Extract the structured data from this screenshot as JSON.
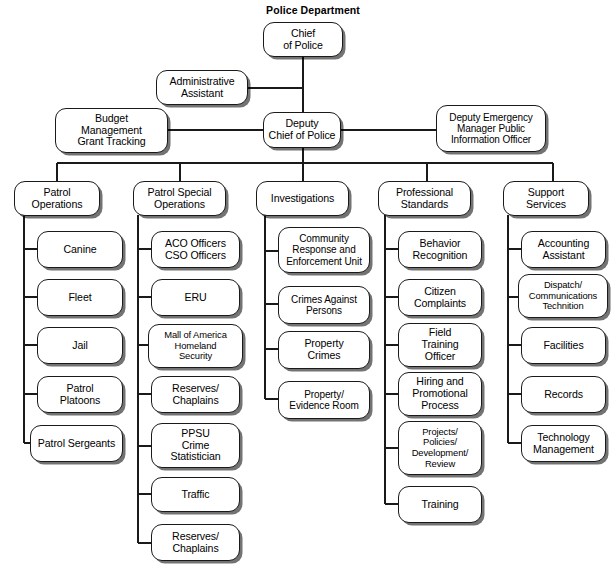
{
  "title": "Police Department",
  "colors": {
    "border": "#1a1a1a",
    "fill": "#ffffff",
    "shadow": "#000000",
    "text": "#000000"
  },
  "chart_data": {
    "type": "diagram",
    "subtype": "organizational-chart",
    "title": "Police Department",
    "orientation": "top-down",
    "nodes": [
      {
        "id": "chief",
        "label": "Chief\nof Police",
        "level": 0
      },
      {
        "id": "admin_assistant",
        "label": "Administrative\nAssistant",
        "level": 1,
        "attached_to": "chief-deputy-trunk"
      },
      {
        "id": "budget",
        "label": "Budget\nManagement\nGrant Tracking",
        "level": 2,
        "attached_to": "deputy_chief"
      },
      {
        "id": "deputy_chief",
        "label": "Deputy\nChief of Police",
        "level": 2,
        "parent": "chief"
      },
      {
        "id": "deputy_emergency",
        "label": "Deputy Emergency\nManager Public\nInformation Officer",
        "level": 2,
        "attached_to": "deputy_chief"
      }
    ],
    "divisions": [
      {
        "id": "patrol_operations",
        "label": "Patrol\nOperations",
        "parent": "deputy_chief",
        "children": [
          "Canine",
          "Fleet",
          "Jail",
          "Patrol\nPlatoons",
          "Patrol Sergeants"
        ]
      },
      {
        "id": "patrol_special_operations",
        "label": "Patrol Special\nOperations",
        "parent": "deputy_chief",
        "children": [
          "ACO Officers\nCSO Officers",
          "ERU",
          "Mall of America\nHomeland\nSecurity",
          "Reserves/\nChaplains",
          "PPSU\nCrime\nStatistician",
          "Traffic",
          "Reserves/\nChaplains"
        ]
      },
      {
        "id": "investigations",
        "label": "Investigations",
        "parent": "deputy_chief",
        "children": [
          "Community\nResponse and\nEnforcement Unit",
          "Crimes Against\nPersons",
          "Property\nCrimes",
          "Property/\nEvidence Room"
        ]
      },
      {
        "id": "professional_standards",
        "label": "Professional\nStandards",
        "parent": "deputy_chief",
        "children": [
          "Behavior\nRecognition",
          "Citizen\nComplaints",
          "Field\nTraining\nOfficer",
          "Hiring and\nPromotional\nProcess",
          "Projects/\nPolicies/\nDevelopment/\nReview",
          "Training"
        ]
      },
      {
        "id": "support_services",
        "label": "Support\nServices",
        "parent": "deputy_chief",
        "children": [
          "Accounting\nAssistant",
          "Dispatch/\nCommunications\nTechnition",
          "Facilities",
          "Records",
          "Technology\nManagement"
        ]
      }
    ]
  },
  "nodes": {
    "chief": "Chief\nof Police",
    "admin_assistant": "Administrative\nAssistant",
    "budget": "Budget\nManagement\nGrant Tracking",
    "deputy_chief": "Deputy\nChief of Police",
    "deputy_emergency": "Deputy Emergency\nManager Public\nInformation Officer",
    "div1": "Patrol\nOperations",
    "div2": "Patrol Special\nOperations",
    "div3": "Investigations",
    "div4": "Professional\nStandards",
    "div5": "Support\nServices",
    "c1_0": "Canine",
    "c1_1": "Fleet",
    "c1_2": "Jail",
    "c1_3": "Patrol\nPlatoons",
    "c1_4": "Patrol Sergeants",
    "c2_0": "ACO Officers\nCSO Officers",
    "c2_1": "ERU",
    "c2_2": "Mall of America\nHomeland\nSecurity",
    "c2_3": "Reserves/\nChaplains",
    "c2_4": "PPSU\nCrime\nStatistician",
    "c2_5": "Traffic",
    "c2_6": "Reserves/\nChaplains",
    "c3_0": "Community\nResponse and\nEnforcement Unit",
    "c3_1": "Crimes Against\nPersons",
    "c3_2": "Property\nCrimes",
    "c3_3": "Property/\nEvidence Room",
    "c4_0": "Behavior\nRecognition",
    "c4_1": "Citizen\nComplaints",
    "c4_2": "Field\nTraining\nOfficer",
    "c4_3": "Hiring and\nPromotional\nProcess",
    "c4_4": "Projects/\nPolicies/\nDevelopment/\nReview",
    "c4_5": "Training",
    "c5_0": "Accounting\nAssistant",
    "c5_1": "Dispatch/\nCommunications\nTechnition",
    "c5_2": "Facilities",
    "c5_3": "Records",
    "c5_4": "Technology\nManagement"
  }
}
